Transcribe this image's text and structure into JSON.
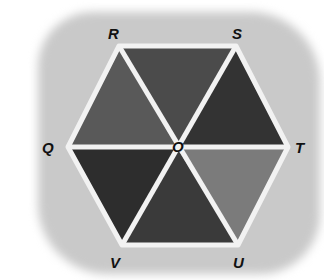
{
  "figure": {
    "type": "regular hexagon divided into six triangles from center",
    "center": {
      "label": "O",
      "x": 177,
      "y": 148
    },
    "vertices": [
      {
        "label": "R",
        "x": 119,
        "y": 46,
        "label_x": 108,
        "label_y": 26
      },
      {
        "label": "S",
        "x": 236,
        "y": 46,
        "label_x": 232,
        "label_y": 26
      },
      {
        "label": "T",
        "x": 288,
        "y": 147,
        "label_x": 295,
        "label_y": 140
      },
      {
        "label": "U",
        "x": 238,
        "y": 245,
        "label_x": 233,
        "label_y": 255
      },
      {
        "label": "V",
        "x": 122,
        "y": 245,
        "label_x": 110,
        "label_y": 255
      },
      {
        "label": "Q",
        "x": 68,
        "y": 147,
        "label_x": 42,
        "label_y": 140
      }
    ],
    "triangles": [
      {
        "name": "ROS",
        "fill": "#4b4b4b"
      },
      {
        "name": "SOT",
        "fill": "#333333"
      },
      {
        "name": "TOU",
        "fill": "#7b7b7b"
      },
      {
        "name": "UOV",
        "fill": "#3a3a3a"
      },
      {
        "name": "VOQ",
        "fill": "#2d2d2d"
      },
      {
        "name": "QOR",
        "fill": "#595959"
      }
    ],
    "edge_color": "#f2f2f2",
    "background_color": "#c9c9c9"
  }
}
